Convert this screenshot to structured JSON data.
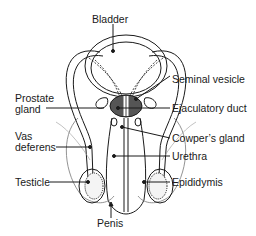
{
  "diagram": {
    "type": "anatomical-diagram",
    "labels": {
      "bladder": "Bladder",
      "seminal_vesicle": "Seminal vesicle",
      "prostate_line1": "Prostate",
      "prostate_line2": "gland",
      "ejaculatory_duct": "Ejaculatory duct",
      "cowpers_gland": "Cowper’s gland",
      "vas_line1": "Vas",
      "vas_line2": "deferens",
      "urethra": "Urethra",
      "testicle": "Testicle",
      "epididymis": "Epididymis",
      "penis": "Penis"
    },
    "colors": {
      "line": "#1a1a1a",
      "fill_dark": "#555555",
      "background": "#ffffff"
    }
  }
}
